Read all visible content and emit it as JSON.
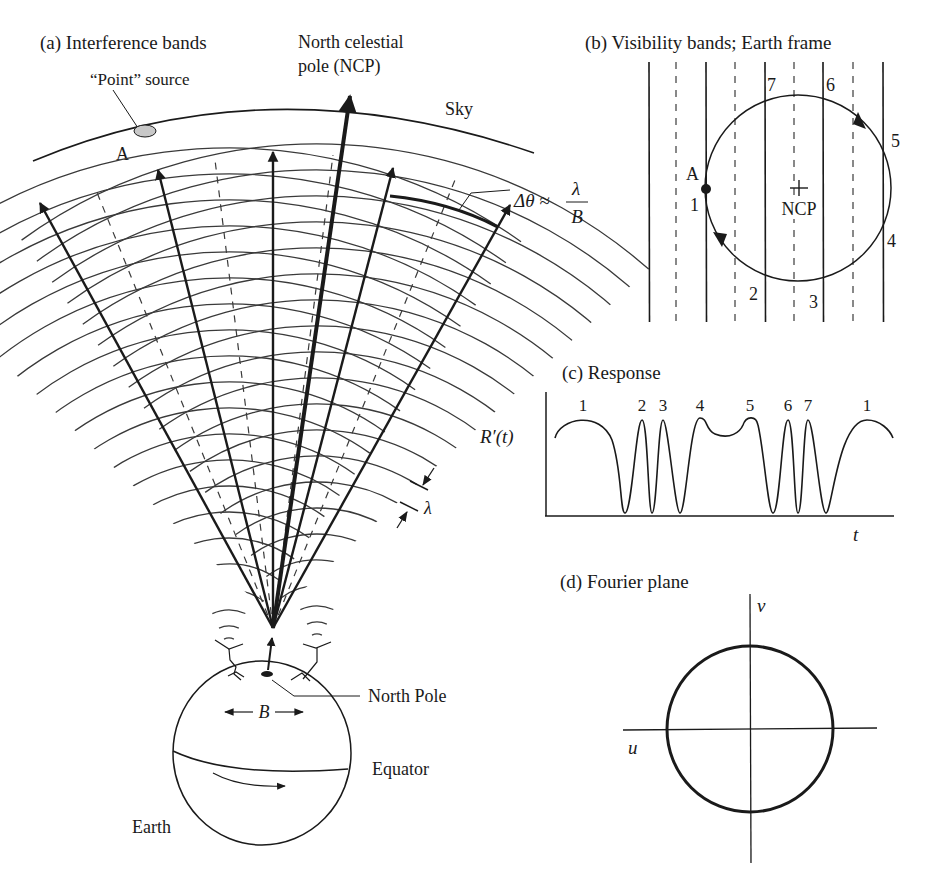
{
  "figure": {
    "panel_a": {
      "title": "(a) Interference bands",
      "ncp_label_line1": "North celestial",
      "ncp_label_line2": "pole (NCP)",
      "sky_label": "Sky",
      "source_label": "“Point” source",
      "source_id": "A",
      "delta_theta_lhs": "Δθ ≈",
      "delta_theta_num": "λ",
      "delta_theta_den": "B",
      "lambda_label": "λ",
      "baseline_label": "B",
      "north_pole_label": "North Pole",
      "equator_label": "Equator",
      "earth_label": "Earth",
      "source_fill": "#c8c8c8"
    },
    "panel_b": {
      "title": "(b) Visibility bands; Earth frame",
      "center_label": "NCP",
      "source_label": "A",
      "crossing_labels": [
        "1",
        "2",
        "3",
        "4",
        "5",
        "6",
        "7"
      ]
    },
    "panel_c": {
      "title": "(c) Response",
      "ylabel": "R′(t)",
      "xlabel": "t",
      "peak_labels": [
        "1",
        "2",
        "3",
        "4",
        "5",
        "6",
        "7",
        "1"
      ]
    },
    "panel_d": {
      "title": "(d) Fourier plane",
      "u_label": "u",
      "v_label": "v"
    }
  },
  "chart_data": {
    "type": "line",
    "title": "(c) Response",
    "xlabel": "t",
    "ylabel": "R′(t)",
    "ylim": [
      0,
      1
    ],
    "peaks": [
      "1",
      "2",
      "3",
      "4",
      "5",
      "6",
      "7",
      "1"
    ],
    "x": [
      0.0,
      0.08,
      0.17,
      0.22,
      0.25,
      0.28,
      0.31,
      0.34,
      0.37,
      0.4,
      0.43,
      0.45,
      0.5,
      0.55,
      0.58,
      0.6,
      0.65,
      0.68,
      0.7,
      0.73,
      0.76,
      0.79,
      0.83,
      0.91,
      1.0
    ],
    "y": [
      0.82,
      1.0,
      0.0,
      1.0,
      0.0,
      1.0,
      0.0,
      1.0,
      0.88,
      0.82,
      0.88,
      1.0,
      0.0,
      1.0,
      0.0,
      1.0,
      0.0,
      1.0,
      0.82,
      0.82,
      0.82,
      0.82,
      0.82,
      1.0,
      0.82
    ]
  }
}
